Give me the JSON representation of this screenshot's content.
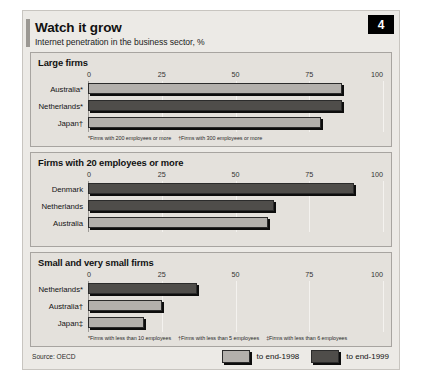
{
  "header": {
    "title": "Watch it grow",
    "subtitle": "Internet penetration in the business sector, %",
    "badge": "4"
  },
  "footer": {
    "source": "Source: OECD",
    "legend": [
      {
        "label": "to end-1998",
        "series": "1998",
        "color": "#b3b0ac"
      },
      {
        "label": "to end-1999",
        "series": "1999",
        "color": "#4f4d4a"
      }
    ]
  },
  "chart_data": {
    "type": "bar",
    "title": "Watch it grow",
    "subtitle": "Internet penetration in the business sector, %",
    "xlabel": "",
    "ylabel": "",
    "xlim": [
      0,
      100
    ],
    "ticks": [
      "0",
      "25",
      "50",
      "75",
      "100"
    ],
    "tick_values": [
      0,
      25,
      50,
      75,
      100
    ],
    "grid": true,
    "orientation": "horizontal",
    "legend_position": "bottom-right",
    "legend": [
      "to end-1998",
      "to end-1999"
    ],
    "panels": [
      {
        "title": "Large firms",
        "categories": [
          "Australia*",
          "Netherlands*",
          "Japan†"
        ],
        "bars": [
          {
            "label": "Australia*",
            "value": 86,
            "series": "to end-1998"
          },
          {
            "label": "Netherlands*",
            "value": 86,
            "series": "to end-1999"
          },
          {
            "label": "Japan†",
            "value": 79,
            "series": "to end-1998"
          }
        ],
        "footnotes": [
          "*Firms with 200 employees or more",
          "†Firms with 300 employees or more"
        ]
      },
      {
        "title": "Firms with 20 employees or more",
        "categories": [
          "Denmark",
          "Netherlands",
          "Australia"
        ],
        "bars": [
          {
            "label": "Denmark",
            "value": 90,
            "series": "to end-1999"
          },
          {
            "label": "Netherlands",
            "value": 63,
            "series": "to end-1999"
          },
          {
            "label": "Australia",
            "value": 61,
            "series": "to end-1998"
          }
        ],
        "footnotes": []
      },
      {
        "title": "Small and very small firms",
        "categories": [
          "Netherlands*",
          "Australia†",
          "Japan‡"
        ],
        "bars": [
          {
            "label": "Netherlands*",
            "value": 37,
            "series": "to end-1999"
          },
          {
            "label": "Australia†",
            "value": 25,
            "series": "to end-1998"
          },
          {
            "label": "Japan‡",
            "value": 19,
            "series": "to end-1998"
          }
        ],
        "footnotes": [
          "*Firms with less than 10 employees",
          "†Firms with less than 5 employees",
          "‡Firms with less than 6 employees"
        ]
      }
    ]
  }
}
